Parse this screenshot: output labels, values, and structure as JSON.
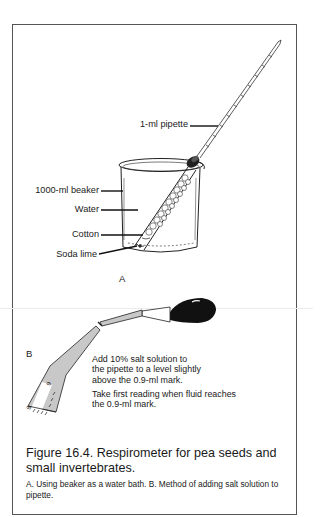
{
  "figure": {
    "number": "Figure 16.4.",
    "title": "Figure 16.4. Respirometer for pea seeds and small invertebrates.",
    "caption": "A. Using beaker as a water bath. B. Method of adding salt solution to pipette."
  },
  "panel_a": {
    "label": "A",
    "callouts": {
      "pipette": "1-ml pipette",
      "beaker": "1000-ml beaker",
      "water": "Water",
      "cotton": "Cotton",
      "soda_lime": "Soda lime"
    }
  },
  "panel_b": {
    "label": "B",
    "instructions": [
      "Add 10% salt solution to the pipette to a level slightly above the 0.9-ml mark.",
      "Take first reading when fluid reaches the 0.9-ml mark."
    ],
    "scale_marks": [
      "8",
      "9"
    ]
  },
  "colors": {
    "ink": "#1a1a1a",
    "fill_gray": "#c8c8c8",
    "bulb": "#111111",
    "frame": "#555555"
  }
}
